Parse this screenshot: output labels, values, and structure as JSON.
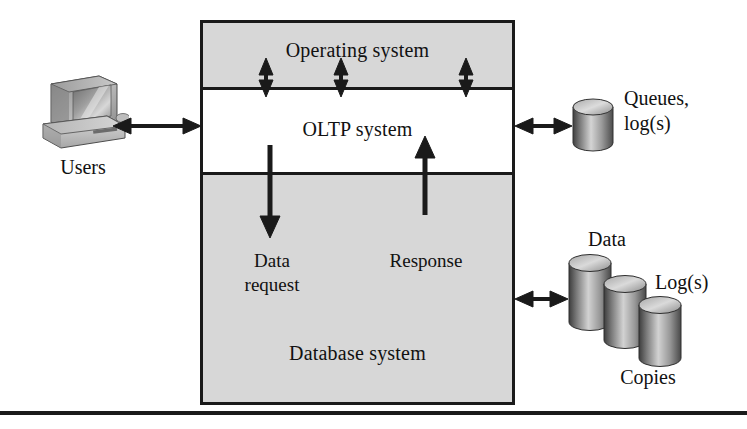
{
  "system_box": {
    "layers": [
      {
        "id": "os",
        "label": "Operating system"
      },
      {
        "id": "oltp",
        "label": "OLTP system"
      },
      {
        "id": "db",
        "label": "Database system"
      }
    ]
  },
  "flows": {
    "data_request": "Data\nrequest",
    "data_request_line1": "Data",
    "data_request_line2": "request",
    "response": "Response"
  },
  "left": {
    "caption": "Users",
    "icon": "desktop-computer-icon"
  },
  "right": {
    "queues_line1": "Queues,",
    "queues_line2": "log(s)",
    "data": "Data",
    "logs": "Log(s)",
    "copies": "Copies"
  },
  "colors": {
    "band_gray": "#d7d7d7",
    "stroke": "#1a1a1a",
    "white": "#ffffff",
    "cylinder_dark": "#4a4a4a",
    "cylinder_light": "#e8e8e8"
  },
  "connectors": [
    {
      "id": "users-to-oltp",
      "type": "double-arrow-horizontal"
    },
    {
      "id": "oltp-to-queues",
      "type": "double-arrow-horizontal"
    },
    {
      "id": "db-to-storage",
      "type": "double-arrow-horizontal"
    },
    {
      "id": "os-oltp-1",
      "type": "double-arrow-vertical"
    },
    {
      "id": "os-oltp-2",
      "type": "double-arrow-vertical"
    },
    {
      "id": "os-oltp-3",
      "type": "double-arrow-vertical"
    },
    {
      "id": "request-down",
      "type": "single-arrow-down"
    },
    {
      "id": "response-up",
      "type": "single-arrow-up"
    }
  ]
}
